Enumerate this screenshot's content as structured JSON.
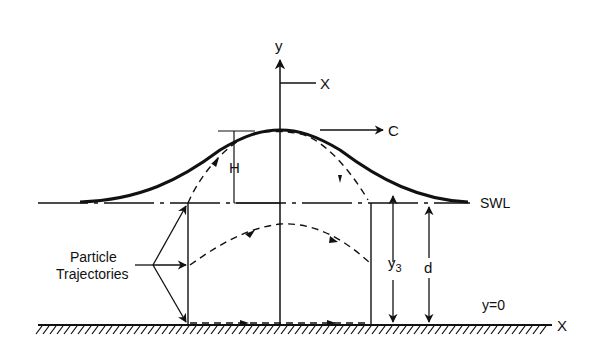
{
  "diagram": {
    "colors": {
      "ink": "#111111",
      "background": "#ffffff"
    },
    "labels": {
      "y_axis": "y",
      "x_moving": "X",
      "celerity": "C",
      "wave_height": "H",
      "swl": "SWL",
      "particle_line1": "Particle",
      "particle_line2": "Trajectories",
      "y3_main": "y",
      "y3_sub": "3",
      "depth": "d",
      "bottom_eq": "y=0",
      "x_bottom": "X"
    }
  }
}
